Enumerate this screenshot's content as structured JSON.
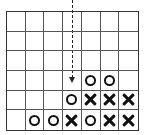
{
  "game": {
    "type": "connect-four",
    "columns": 7,
    "rows": 6,
    "drop_column": 3,
    "board": [
      [
        "",
        "",
        "",
        "",
        "",
        "",
        ""
      ],
      [
        "",
        "",
        "",
        "",
        "",
        "",
        ""
      ],
      [
        "",
        "",
        "",
        "",
        "",
        "",
        ""
      ],
      [
        "",
        "",
        "",
        "",
        "O",
        "O",
        ""
      ],
      [
        "",
        "",
        "",
        "O",
        "X",
        "X",
        "X"
      ],
      [
        "",
        "O",
        "O",
        "X",
        "O",
        "X",
        "X"
      ]
    ],
    "colors": {
      "line": "#555555",
      "piece": "#111111",
      "background": "#ffffff"
    }
  }
}
